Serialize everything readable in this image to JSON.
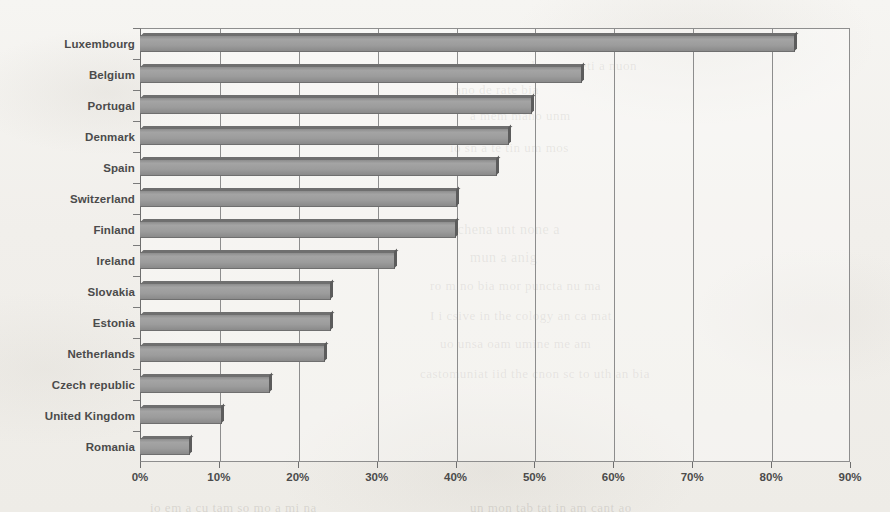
{
  "chart_data": {
    "type": "bar",
    "orientation": "horizontal",
    "title": "",
    "subtitle": "",
    "xlabel": "",
    "ylabel": "",
    "xlim": [
      0,
      90
    ],
    "xtick_labels": [
      "0%",
      "10%",
      "20%",
      "30%",
      "40%",
      "50%",
      "60%",
      "70%",
      "80%",
      "90%"
    ],
    "xtick_values": [
      0,
      10,
      20,
      30,
      40,
      50,
      60,
      70,
      80,
      90
    ],
    "grid": "vertical",
    "legend": "none",
    "value_unit": "%",
    "categories": [
      "Luxembourg",
      "Belgium",
      "Portugal",
      "Denmark",
      "Spain",
      "Switzerland",
      "Finland",
      "Ireland",
      "Slovakia",
      "Estonia",
      "Netherlands",
      "Czech republic",
      "United Kingdom",
      "Romania"
    ],
    "values": [
      83,
      56,
      49.7,
      46.8,
      45.3,
      40.2,
      40,
      32.3,
      24.2,
      24.2,
      23.4,
      16.5,
      10.4,
      6.3
    ],
    "series": [
      {
        "name": "",
        "values": [
          83,
          56,
          49.7,
          46.8,
          45.3,
          40.2,
          40,
          32.3,
          24.2,
          24.2,
          23.4,
          16.5,
          10.4,
          6.3
        ]
      }
    ],
    "bar_color": "#9c9c9c",
    "bar_edge_color": "#5f5f5f"
  },
  "background": {
    "paper_color": "#f3f2ef",
    "bleed_through": [
      {
        "text": "a pun amb nam meti a nuon",
        "x": 480,
        "y": 58,
        "size": 13
      },
      {
        "text": "ano de rate bia",
        "x": 455,
        "y": 82,
        "size": 13
      },
      {
        "text": "a mem mano unm",
        "x": 470,
        "y": 108,
        "size": 13
      },
      {
        "text": "io sn a te tin um mos",
        "x": 450,
        "y": 140,
        "size": 13
      },
      {
        "text": "us chena unt none a",
        "x": 440,
        "y": 222,
        "size": 14
      },
      {
        "text": "mun a anig",
        "x": 470,
        "y": 250,
        "size": 14
      },
      {
        "text": "ro m no bia mor puncta nu ma",
        "x": 430,
        "y": 278,
        "size": 13
      },
      {
        "text": "I i csive in the cology an ca mat",
        "x": 430,
        "y": 308,
        "size": 13
      },
      {
        "text": "uo unsa oam umine me am",
        "x": 440,
        "y": 336,
        "size": 13
      },
      {
        "text": "castomuniat iid the cnon sc to uth an bia",
        "x": 420,
        "y": 366,
        "size": 13
      },
      {
        "text": "io em a cu tam so mo a mi na",
        "x": 150,
        "y": 500,
        "size": 13
      },
      {
        "text": "un mon tab tat in am cant ao",
        "x": 470,
        "y": 500,
        "size": 13
      }
    ]
  }
}
